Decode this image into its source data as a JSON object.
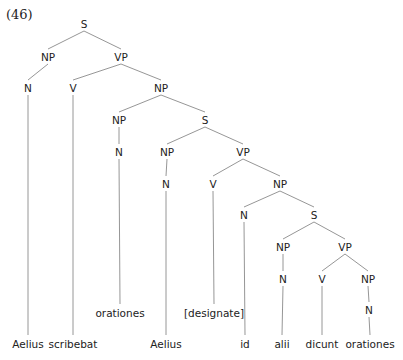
{
  "example_number": "(46)",
  "nodes": [
    {
      "id": "s1",
      "label": "S",
      "x": 84,
      "y": 24
    },
    {
      "id": "np1",
      "label": "NP",
      "x": 48,
      "y": 57
    },
    {
      "id": "vp1",
      "label": "VP",
      "x": 121,
      "y": 57
    },
    {
      "id": "n1",
      "label": "N",
      "x": 28,
      "y": 88
    },
    {
      "id": "v1",
      "label": "V",
      "x": 73,
      "y": 88
    },
    {
      "id": "np2",
      "label": "NP",
      "x": 161,
      "y": 88
    },
    {
      "id": "np3",
      "label": "NP",
      "x": 119,
      "y": 120
    },
    {
      "id": "s2",
      "label": "S",
      "x": 205,
      "y": 120
    },
    {
      "id": "n2",
      "label": "N",
      "x": 119,
      "y": 152
    },
    {
      "id": "np4",
      "label": "NP",
      "x": 167,
      "y": 152
    },
    {
      "id": "vp2",
      "label": "VP",
      "x": 243,
      "y": 152
    },
    {
      "id": "n3",
      "label": "N",
      "x": 166,
      "y": 184
    },
    {
      "id": "v2",
      "label": "V",
      "x": 213,
      "y": 184
    },
    {
      "id": "np5",
      "label": "NP",
      "x": 280,
      "y": 184
    },
    {
      "id": "n4",
      "label": "N",
      "x": 244,
      "y": 215
    },
    {
      "id": "s3",
      "label": "S",
      "x": 314,
      "y": 215
    },
    {
      "id": "np6",
      "label": "NP",
      "x": 283,
      "y": 247
    },
    {
      "id": "vp3",
      "label": "VP",
      "x": 345,
      "y": 247
    },
    {
      "id": "n5",
      "label": "N",
      "x": 283,
      "y": 279
    },
    {
      "id": "v3",
      "label": "V",
      "x": 322,
      "y": 279
    },
    {
      "id": "np7",
      "label": "NP",
      "x": 368,
      "y": 279
    },
    {
      "id": "n6",
      "label": "N",
      "x": 369,
      "y": 310
    }
  ],
  "words": [
    {
      "id": "w1",
      "text": "Aelius",
      "x": 28,
      "y": 344,
      "parent": "n1"
    },
    {
      "id": "w2",
      "text": "scribebat",
      "x": 73,
      "y": 344,
      "parent": "v1"
    },
    {
      "id": "w3",
      "text": "orationes",
      "x": 120,
      "y": 313,
      "parent": "n2"
    },
    {
      "id": "w4",
      "text": "Aelius",
      "x": 166,
      "y": 344,
      "parent": "n3"
    },
    {
      "id": "w5",
      "text": "[designate]",
      "x": 214,
      "y": 313,
      "parent": "v2"
    },
    {
      "id": "w6",
      "text": "id",
      "x": 245,
      "y": 344,
      "parent": "n4"
    },
    {
      "id": "w7",
      "text": "alii",
      "x": 282,
      "y": 344,
      "parent": "n5"
    },
    {
      "id": "w8",
      "text": "dicunt",
      "x": 322,
      "y": 344,
      "parent": "v3"
    },
    {
      "id": "w9",
      "text": "orationes",
      "x": 370,
      "y": 344,
      "parent": "n6"
    }
  ],
  "edges": [
    [
      "s1",
      "np1"
    ],
    [
      "s1",
      "vp1"
    ],
    [
      "np1",
      "n1"
    ],
    [
      "vp1",
      "v1"
    ],
    [
      "vp1",
      "np2"
    ],
    [
      "np2",
      "np3"
    ],
    [
      "np2",
      "s2"
    ],
    [
      "np3",
      "n2"
    ],
    [
      "s2",
      "np4"
    ],
    [
      "s2",
      "vp2"
    ],
    [
      "np4",
      "n3"
    ],
    [
      "vp2",
      "v2"
    ],
    [
      "vp2",
      "np5"
    ],
    [
      "np5",
      "n4"
    ],
    [
      "np5",
      "s3"
    ],
    [
      "s3",
      "np6"
    ],
    [
      "s3",
      "vp3"
    ],
    [
      "np6",
      "n5"
    ],
    [
      "vp3",
      "v3"
    ],
    [
      "vp3",
      "np7"
    ],
    [
      "np7",
      "n6"
    ]
  ]
}
